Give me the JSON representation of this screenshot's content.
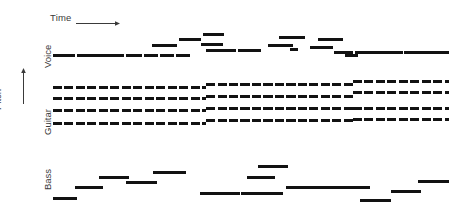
{
  "figure": {
    "type": "piano-roll",
    "title": "",
    "background": "#ffffff",
    "note_color": "#121212",
    "width": 454,
    "height": 212
  },
  "axes": {
    "time": {
      "label": "Time",
      "arrow": "arrow-right",
      "direction": "left-to-right"
    },
    "pitch": {
      "label": "Pitch",
      "arrow": "arrow-up",
      "direction": "bottom-to-top"
    }
  },
  "tracks": [
    {
      "id": "voice",
      "label": "Voice",
      "style": "solid"
    },
    {
      "id": "guitar",
      "label": "Guitar",
      "style": "dashed"
    },
    {
      "id": "bass",
      "label": "Bass",
      "style": "solid"
    }
  ],
  "chart_data": {
    "type": "piano-roll",
    "title": "",
    "xlabel": "Time",
    "ylabel": "Pitch",
    "grid": false,
    "legend": "none",
    "xlim": [
      0,
      454
    ],
    "ylim": [
      212,
      0
    ],
    "series": [
      {
        "name": "Voice",
        "style": "solid",
        "notes": [
          {
            "x": 53,
            "w": 22,
            "y": 54
          },
          {
            "x": 77,
            "w": 47,
            "y": 54
          },
          {
            "x": 126,
            "w": 16,
            "y": 54
          },
          {
            "x": 144,
            "w": 14,
            "y": 54
          },
          {
            "x": 160,
            "w": 14,
            "y": 54
          },
          {
            "x": 176,
            "w": 14,
            "y": 54
          },
          {
            "x": 152,
            "w": 25,
            "y": 44
          },
          {
            "x": 179,
            "w": 22,
            "y": 38
          },
          {
            "x": 203,
            "w": 21,
            "y": 33
          },
          {
            "x": 206,
            "w": 30,
            "y": 49
          },
          {
            "x": 238,
            "w": 23,
            "y": 49
          },
          {
            "x": 201,
            "w": 22,
            "y": 43
          },
          {
            "x": 268,
            "w": 25,
            "y": 44
          },
          {
            "x": 279,
            "w": 26,
            "y": 36
          },
          {
            "x": 310,
            "w": 23,
            "y": 46
          },
          {
            "x": 318,
            "w": 25,
            "y": 38
          },
          {
            "x": 290,
            "w": 8,
            "y": 48
          },
          {
            "x": 334,
            "w": 19,
            "y": 51
          },
          {
            "x": 345,
            "w": 13,
            "y": 54
          },
          {
            "x": 355,
            "w": 48,
            "y": 51
          },
          {
            "x": 404,
            "w": 45,
            "y": 51
          }
        ]
      },
      {
        "name": "Guitar",
        "style": "dashed",
        "lines": [
          {
            "x": 53,
            "w": 153,
            "y": 86,
            "segment": "left-top"
          },
          {
            "x": 53,
            "w": 153,
            "y": 97,
            "segment": "left-2"
          },
          {
            "x": 53,
            "w": 153,
            "y": 109,
            "segment": "left-3"
          },
          {
            "x": 53,
            "w": 153,
            "y": 122,
            "segment": "left-4"
          },
          {
            "x": 206,
            "w": 147,
            "y": 83,
            "segment": "mid-top"
          },
          {
            "x": 206,
            "w": 147,
            "y": 95,
            "segment": "mid-2"
          },
          {
            "x": 206,
            "w": 147,
            "y": 107,
            "segment": "mid-3"
          },
          {
            "x": 206,
            "w": 147,
            "y": 119,
            "segment": "mid-4"
          },
          {
            "x": 353,
            "w": 96,
            "y": 80,
            "segment": "right-top"
          },
          {
            "x": 353,
            "w": 96,
            "y": 91,
            "segment": "right-2"
          },
          {
            "x": 353,
            "w": 96,
            "y": 107,
            "segment": "right-3"
          },
          {
            "x": 353,
            "w": 96,
            "y": 118,
            "segment": "right-4"
          }
        ]
      },
      {
        "name": "Bass",
        "style": "solid",
        "notes": [
          {
            "x": 53,
            "w": 24,
            "y": 197
          },
          {
            "x": 75,
            "w": 28,
            "y": 186
          },
          {
            "x": 99,
            "w": 30,
            "y": 176
          },
          {
            "x": 126,
            "w": 31,
            "y": 181
          },
          {
            "x": 153,
            "w": 33,
            "y": 171
          },
          {
            "x": 200,
            "w": 40,
            "y": 192
          },
          {
            "x": 241,
            "w": 42,
            "y": 192
          },
          {
            "x": 247,
            "w": 28,
            "y": 176
          },
          {
            "x": 258,
            "w": 30,
            "y": 165
          },
          {
            "x": 286,
            "w": 37,
            "y": 186
          },
          {
            "x": 293,
            "w": 44,
            "y": 186
          },
          {
            "x": 330,
            "w": 40,
            "y": 186
          },
          {
            "x": 360,
            "w": 31,
            "y": 199
          },
          {
            "x": 391,
            "w": 30,
            "y": 190
          },
          {
            "x": 418,
            "w": 31,
            "y": 180
          }
        ]
      }
    ]
  }
}
